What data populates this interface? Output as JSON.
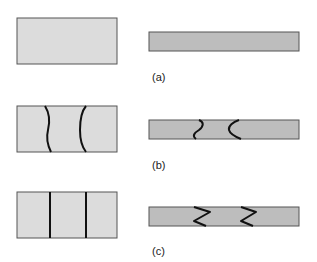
{
  "figure": {
    "colors": {
      "light_fill": "#dcdcdc",
      "dark_fill": "#bdbdbd",
      "border": "#555555",
      "boundary_line": "#111111"
    },
    "panels": [
      {
        "id": "a",
        "label": "(a)",
        "description": "Plain specimen: plan view (left) and side view (right), no boundaries"
      },
      {
        "id": "b",
        "label": "(b)",
        "description": "Two curved boundaries across plan view; curved/wavy boundary profiles in side view"
      },
      {
        "id": "c",
        "label": "(c)",
        "description": "Two straight vertical boundaries across plan view; zigzag boundary profiles in side view"
      }
    ]
  }
}
